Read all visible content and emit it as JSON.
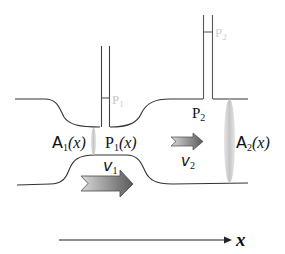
{
  "diagram": {
    "type": "venturi-pipe-flow",
    "colors": {
      "wall": "#333333",
      "tube": "#555555",
      "faded_label": "#c8c8c8",
      "label": "#111111",
      "arrow_dark": "#5a5a5a",
      "arrow_light": "#d0d0d0",
      "ellipse": "#d4d4d4"
    },
    "labels": {
      "p1_tube": "P",
      "p1_tube_sub": "1",
      "p2_tube": "P",
      "p2_tube_sub": "2",
      "p2_pipe": "P",
      "p2_pipe_sub": "2",
      "a1": "A",
      "a1_sub": "1",
      "a1_arg": "(x)",
      "p1_pipe": "P",
      "p1_pipe_sub": "1",
      "p1_pipe_arg": "(x)",
      "v1": "v",
      "v1_sub": "1",
      "v2": "v",
      "v2_sub": "2",
      "a2": "A",
      "a2_sub": "2",
      "a2_arg": "(x)",
      "axis": "x"
    }
  }
}
